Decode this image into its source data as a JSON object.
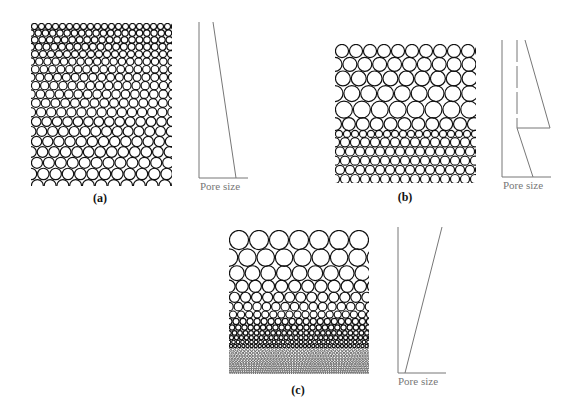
{
  "figure": {
    "panels": [
      {
        "id": "a",
        "label": "(a)",
        "description": "Gradual increase of particle size from top to bottom",
        "array": {
          "x": 31,
          "y": 23,
          "w": 141,
          "h": 163,
          "top_diameter": 7,
          "bottom_diameter": 13,
          "profile": "linear"
        },
        "plot": {
          "axis_label": "Pore size",
          "axis_x": 199,
          "axis_top": 22,
          "axis_bottom": 178,
          "axis_right": 248,
          "lines": [
            [
              [
                213,
                22
              ],
              [
                236,
                178
              ]
            ]
          ],
          "dashed": []
        },
        "label_pos": {
          "x": 100,
          "y": 191
        },
        "axis_label_pos": {
          "x": 200,
          "y": 180
        }
      },
      {
        "id": "b",
        "label": "(b)",
        "description": "Larger particles on top, a band of small particles beneath",
        "array": {
          "x": 335,
          "y": 44,
          "w": 141,
          "h": 139,
          "profile": "two-layer",
          "upper_top_diameter": 14,
          "upper_bottom_diameter": 20,
          "split_y": 131,
          "lower_diameter": 10
        },
        "plot": {
          "axis_label": "Pore size",
          "axis_x": 502,
          "axis_top": 40,
          "axis_bottom": 177,
          "axis_right": 551,
          "lines": [
            [
              [
                525,
                40
              ],
              [
                550,
                128
              ]
            ],
            [
              [
                550,
                128
              ],
              [
                517,
                128
              ]
            ],
            [
              [
                517,
                128
              ],
              [
                533,
                177
              ]
            ]
          ],
          "dashed": [
            [
              [
                517,
                40
              ],
              [
                517,
                128
              ]
            ]
          ]
        },
        "label_pos": {
          "x": 405,
          "y": 190
        },
        "axis_label_pos": {
          "x": 503,
          "y": 179
        }
      },
      {
        "id": "c",
        "label": "(c)",
        "description": "Continuous decrease of particle size from top to bottom",
        "array": {
          "x": 229,
          "y": 230,
          "w": 140,
          "h": 144,
          "top_diameter": 20,
          "bottom_diameter": 2,
          "profile": "geometric"
        },
        "plot": {
          "axis_label": "Pore size",
          "axis_x": 398,
          "axis_top": 227,
          "axis_bottom": 373,
          "axis_right": 446,
          "lines": [
            [
              [
                405,
                373
              ],
              [
                442,
                227
              ]
            ]
          ],
          "dashed": []
        },
        "label_pos": {
          "x": 298,
          "y": 383
        },
        "axis_label_pos": {
          "x": 398,
          "y": 375
        }
      }
    ]
  },
  "labels": {
    "a": "(a)",
    "b": "(b)",
    "c": "(c)",
    "pore_size": "Pore size"
  },
  "colors": {
    "ink": "#111111",
    "axis": "#777777",
    "background": "#ffffff"
  }
}
